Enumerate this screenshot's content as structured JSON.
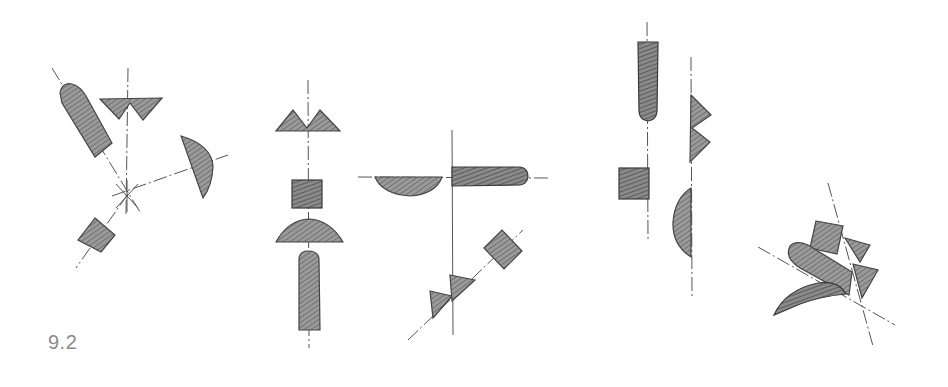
{
  "figure": {
    "label": "9.2",
    "colors": {
      "fill": "#8c8c8c",
      "stroke": "#444444",
      "axis": "#555555",
      "label": "#8a8a8a",
      "background": "#ffffff"
    },
    "groups": [
      {
        "id": "radial",
        "description": "Shapes arranged radially around a central point: rounded bar, double triangle, half-disc, square"
      },
      {
        "id": "vertical-axis",
        "description": "Shapes stacked along a vertical axis: double triangle, square, half-disc, rounded bar"
      },
      {
        "id": "cross-axes",
        "description": "Half-disc and rounded bar on a horizontal axis; triangles and square on a diagonal axis"
      },
      {
        "id": "parallel-axes",
        "description": "Rounded bar and square on one vertical axis; double triangle and half-disc on a parallel vertical axis"
      },
      {
        "id": "overlapping-cluster",
        "description": "Overlapping square, triangles, rounded bar and leaf-shaped half-disc along two crossing axes"
      }
    ]
  }
}
